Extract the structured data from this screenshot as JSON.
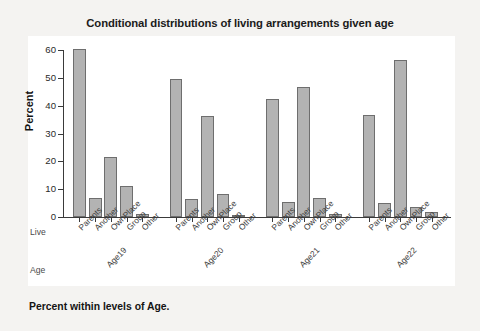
{
  "chart_data": {
    "type": "bar",
    "title": "Conditional distributions of living arrangements given age",
    "xlabel": "",
    "ylabel": "Percent",
    "ylim": [
      0,
      60
    ],
    "yticks": [
      0,
      10,
      20,
      30,
      40,
      50,
      60
    ],
    "grid": false,
    "legend": false,
    "categories": [
      "Parents",
      "Another",
      "OwnPlace",
      "Group",
      "Other"
    ],
    "groups": [
      "Age19",
      "Age20",
      "Age21",
      "Age22"
    ],
    "group_axis_label": "Age",
    "category_axis_label": "Live",
    "series": [
      {
        "name": "Age19",
        "values": [
          60.3,
          7.0,
          21.5,
          11.0,
          1.1
        ]
      },
      {
        "name": "Age20",
        "values": [
          49.5,
          6.5,
          36.4,
          8.1,
          0.6
        ]
      },
      {
        "name": "Age21",
        "values": [
          42.3,
          5.5,
          46.8,
          6.8,
          0.9
        ]
      },
      {
        "name": "Age22",
        "values": [
          36.8,
          5.0,
          56.3,
          3.5,
          1.8
        ]
      }
    ],
    "bar_fill_color": "#b3b3b3",
    "bar_edge_color": "#6e6e6e",
    "panel_color": "#ffffff",
    "page_color": "#f4f3f1",
    "footnote": "Percent within levels of Age."
  },
  "footer": {
    "note": "Percent within levels of Age."
  },
  "axis": {
    "y_title": "Percent",
    "row_live": "Live",
    "row_age": "Age"
  }
}
